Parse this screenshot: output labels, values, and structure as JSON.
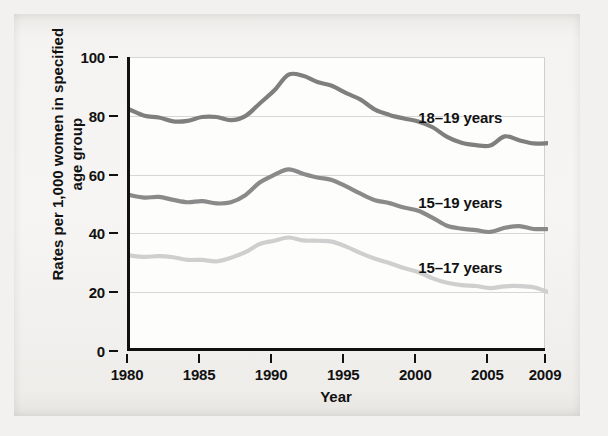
{
  "chart_data": {
    "type": "line",
    "title": "",
    "xlabel": "Year",
    "ylabel": "Rates per 1,000 women in specified age group",
    "xlim": [
      1980,
      2009
    ],
    "ylim": [
      0,
      100
    ],
    "grid": true,
    "legend_position": "inline-right",
    "xticks": [
      "1980",
      "1985",
      "1990",
      "1995",
      "2000",
      "2005",
      "2009"
    ],
    "xtick_values": [
      1980,
      1985,
      1990,
      1995,
      2000,
      2005,
      2009
    ],
    "yticks": [
      "0",
      "20",
      "40",
      "60",
      "80",
      "100"
    ],
    "ytick_values": [
      0,
      20,
      40,
      60,
      80,
      100
    ],
    "x": [
      1980,
      1981,
      1982,
      1983,
      1984,
      1985,
      1986,
      1987,
      1988,
      1989,
      1990,
      1991,
      1992,
      1993,
      1994,
      1995,
      1996,
      1997,
      1998,
      1999,
      2000,
      2001,
      2002,
      2003,
      2004,
      2005,
      2006,
      2007,
      2008,
      2009
    ],
    "series": [
      {
        "name": "18-19 years",
        "label": "18–19 years",
        "color": "#7f7f7f",
        "label_x": 2000,
        "label_y": 79,
        "values": [
          82.1,
          80.0,
          79.4,
          78.1,
          78.3,
          79.6,
          79.6,
          78.5,
          79.9,
          84.2,
          88.6,
          94.0,
          93.6,
          91.5,
          90.2,
          87.7,
          85.5,
          82.1,
          80.3,
          79.1,
          78.1,
          76.1,
          72.8,
          70.8,
          70.0,
          69.9,
          73.0,
          71.7,
          70.6,
          70.7
        ]
      },
      {
        "name": "15-19 years",
        "label": "15–19 years",
        "color": "#8a8a8a",
        "label_x": 2000,
        "label_y": 50,
        "values": [
          53.0,
          52.2,
          52.4,
          51.4,
          50.6,
          51.0,
          50.2,
          50.6,
          53.0,
          57.3,
          59.9,
          61.8,
          60.3,
          59.0,
          58.2,
          56.0,
          53.5,
          51.3,
          50.3,
          48.8,
          47.7,
          45.3,
          42.6,
          41.6,
          41.1,
          40.5,
          41.9,
          42.5,
          41.5,
          41.5
        ]
      },
      {
        "name": "15-17 years",
        "label": "15–17 years",
        "color": "#cfcfcf",
        "label_x": 2000,
        "label_y": 28,
        "values": [
          32.5,
          32.0,
          32.3,
          31.9,
          31.0,
          31.0,
          30.5,
          31.7,
          33.6,
          36.4,
          37.5,
          38.6,
          37.6,
          37.5,
          37.2,
          35.5,
          33.3,
          31.4,
          29.9,
          28.2,
          26.9,
          24.7,
          23.2,
          22.4,
          22.1,
          21.4,
          22.0,
          22.1,
          21.7,
          20.1
        ]
      }
    ]
  },
  "axis": {
    "x_title": "Year",
    "y_title_line1": "Rates per 1,000 women in specified",
    "y_title_line2": "age group"
  },
  "colors": {
    "axis": "#111111",
    "grid": "#d7d7d7",
    "paper": "#f4f3f1",
    "plot_background": "#fdfdfc"
  }
}
